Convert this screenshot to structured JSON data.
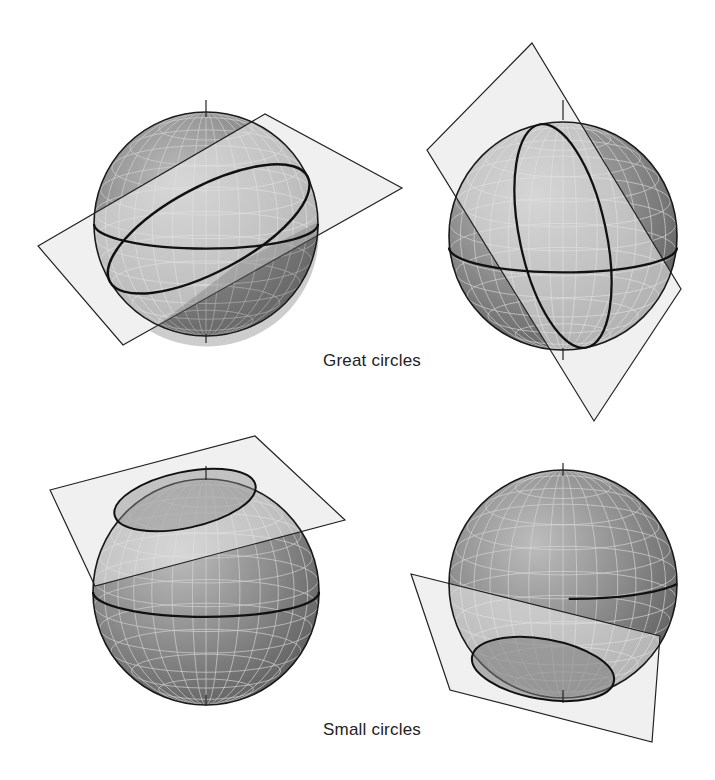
{
  "figure": {
    "captions": {
      "great": "Great circles",
      "small": "Small circles"
    },
    "colors": {
      "sphere_dark": "#6e6e6e",
      "sphere_light": "#b8b8b8",
      "plane_fill": "#e4e4e4",
      "outline": "#1a1a1a",
      "grid": "#d0d0d0"
    },
    "panels": [
      {
        "id": "great-circle-1",
        "label": "Great circle with oblique plane through sphere center (tilted left-to-right)"
      },
      {
        "id": "great-circle-2",
        "label": "Great circle with steep plane through sphere center"
      },
      {
        "id": "small-circle-1",
        "label": "Small circle near north pole from plane cutting top of sphere"
      },
      {
        "id": "small-circle-2",
        "label": "Small circle near south pole from plane cutting bottom of sphere"
      }
    ]
  }
}
